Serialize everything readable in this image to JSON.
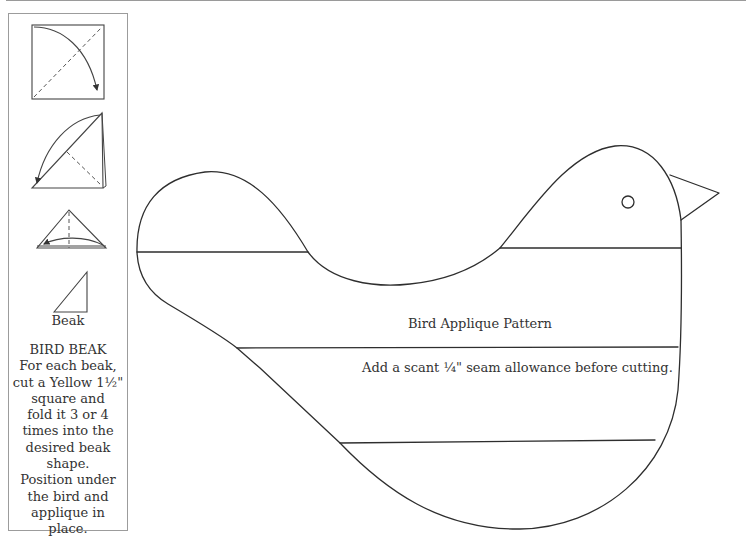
{
  "side_panel": {
    "diagrams": [
      {
        "name": "fold-step-1",
        "description": "square with diagonal dashed fold line and curved arrow"
      },
      {
        "name": "fold-step-2",
        "description": "triangle folded in half with dashed line and curved arrow"
      },
      {
        "name": "fold-step-3",
        "description": "small triangle with vertical dashed center line and curved arrow"
      },
      {
        "name": "beak-final",
        "description": "right triangle beak shape"
      }
    ],
    "beak_caption": "Beak",
    "instructions": {
      "heading": "BIRD BEAK",
      "lines": [
        "For each beak,",
        "cut a Yellow 1½\"",
        "square and",
        "fold it 3 or 4",
        "times into the",
        "desired beak",
        "shape.",
        "Position under",
        "the bird and",
        "applique in",
        "place."
      ]
    }
  },
  "pattern": {
    "title": "Bird Applique Pattern",
    "note": "Add a scant ¼\" seam allowance before cutting."
  },
  "colors": {
    "line": "#2e2e2e",
    "border": "#9c9c9c",
    "background": "#ffffff"
  }
}
